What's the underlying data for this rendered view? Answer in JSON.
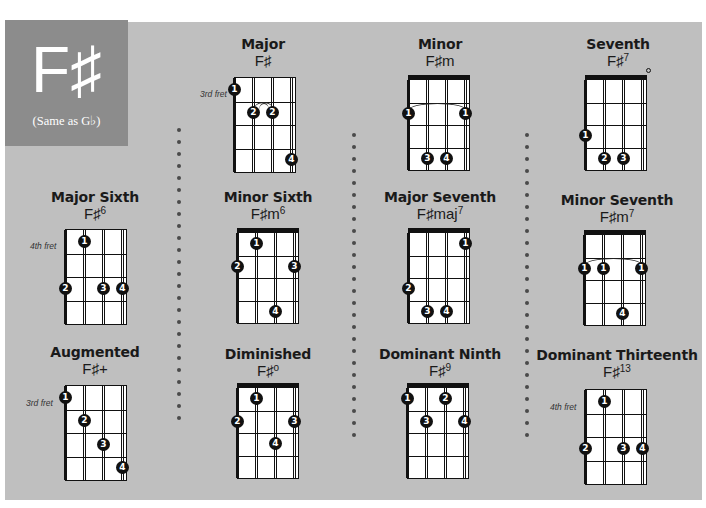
{
  "key": {
    "name": "F♯",
    "note": "(Same as G♭)"
  },
  "colors": {
    "panel": "#bfbfbf",
    "key_box": "#8c8c8c",
    "ink": "#111111"
  },
  "chords": [
    {
      "title": "Major",
      "symbol": "F♯",
      "sup": "",
      "fret_label": "3rd fret",
      "nut": false
    },
    {
      "title": "Minor",
      "symbol": "F♯m",
      "sup": "",
      "fret_label": "",
      "nut": true
    },
    {
      "title": "Seventh",
      "symbol": "F♯",
      "sup": "7",
      "fret_label": "",
      "nut": true
    },
    {
      "title": "Major Sixth",
      "symbol": "F♯",
      "sup": "6",
      "fret_label": "4th fret",
      "nut": false
    },
    {
      "title": "Minor Sixth",
      "symbol": "F♯m",
      "sup": "6",
      "fret_label": "",
      "nut": true
    },
    {
      "title": "Major Seventh",
      "symbol": "F♯maj",
      "sup": "7",
      "fret_label": "",
      "nut": true
    },
    {
      "title": "Minor Seventh",
      "symbol": "F♯m",
      "sup": "7",
      "fret_label": "",
      "nut": true
    },
    {
      "title": "Augmented",
      "symbol": "F♯+",
      "sup": "",
      "fret_label": "3rd fret",
      "nut": false
    },
    {
      "title": "Diminished",
      "symbol": "F♯",
      "sup": "o",
      "fret_label": "",
      "nut": true
    },
    {
      "title": "Dominant Ninth",
      "symbol": "F♯",
      "sup": "9",
      "fret_label": "",
      "nut": true
    },
    {
      "title": "Dominant Thirteenth",
      "symbol": "F♯",
      "sup": "13",
      "fret_label": "4th fret",
      "nut": false
    }
  ],
  "fingerings": {
    "major": [
      {
        "s": 1,
        "f": 1,
        "n": "1"
      },
      {
        "s": 2,
        "f": 2,
        "n": "2"
      },
      {
        "s": 3,
        "f": 2,
        "n": "2"
      },
      {
        "s": 4,
        "f": 4,
        "n": "4"
      }
    ],
    "minor": [
      {
        "s": 1,
        "f": 2,
        "n": "1"
      },
      {
        "s": 4,
        "f": 2,
        "n": "1"
      },
      {
        "s": 2,
        "f": 4,
        "n": "3"
      },
      {
        "s": 3,
        "f": 4,
        "n": "4"
      }
    ],
    "seventh": [
      {
        "s": 1,
        "f": 3,
        "n": "1"
      },
      {
        "s": 2,
        "f": 4,
        "n": "2"
      },
      {
        "s": 3,
        "f": 4,
        "n": "3"
      }
    ],
    "major_sixth": [
      {
        "s": 2,
        "f": 1,
        "n": "1"
      },
      {
        "s": 1,
        "f": 3,
        "n": "2"
      },
      {
        "s": 3,
        "f": 3,
        "n": "3"
      },
      {
        "s": 4,
        "f": 3,
        "n": "4"
      }
    ],
    "minor_sixth": [
      {
        "s": 2,
        "f": 1,
        "n": "1"
      },
      {
        "s": 1,
        "f": 2,
        "n": "2"
      },
      {
        "s": 4,
        "f": 2,
        "n": "3"
      },
      {
        "s": 3,
        "f": 4,
        "n": "4"
      }
    ],
    "major_seventh": [
      {
        "s": 4,
        "f": 1,
        "n": "1"
      },
      {
        "s": 1,
        "f": 3,
        "n": "2"
      },
      {
        "s": 2,
        "f": 4,
        "n": "3"
      },
      {
        "s": 3,
        "f": 4,
        "n": "4"
      }
    ],
    "minor_seventh": [
      {
        "s": 1,
        "f": 2,
        "n": "1"
      },
      {
        "s": 2,
        "f": 2,
        "n": "1"
      },
      {
        "s": 4,
        "f": 2,
        "n": "1"
      },
      {
        "s": 3,
        "f": 4,
        "n": "4"
      }
    ],
    "augmented": [
      {
        "s": 1,
        "f": 1,
        "n": "1"
      },
      {
        "s": 2,
        "f": 2,
        "n": "2"
      },
      {
        "s": 3,
        "f": 3,
        "n": "3"
      },
      {
        "s": 4,
        "f": 4,
        "n": "4"
      }
    ],
    "diminished": [
      {
        "s": 2,
        "f": 1,
        "n": "1"
      },
      {
        "s": 1,
        "f": 2,
        "n": "2"
      },
      {
        "s": 4,
        "f": 2,
        "n": "3"
      },
      {
        "s": 3,
        "f": 3,
        "n": "4"
      }
    ],
    "dominant_ninth": [
      {
        "s": 1,
        "f": 1,
        "n": "1"
      },
      {
        "s": 3,
        "f": 1,
        "n": "2"
      },
      {
        "s": 2,
        "f": 2,
        "n": "3"
      },
      {
        "s": 4,
        "f": 2,
        "n": "4"
      }
    ],
    "dominant_thirteenth": [
      {
        "s": 2,
        "f": 1,
        "n": "1"
      },
      {
        "s": 1,
        "f": 3,
        "n": "2"
      },
      {
        "s": 3,
        "f": 3,
        "n": "3"
      },
      {
        "s": 4,
        "f": 3,
        "n": "4"
      }
    ]
  }
}
